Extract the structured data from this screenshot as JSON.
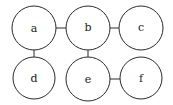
{
  "diagram": {
    "type": "graph",
    "nodes": [
      {
        "id": "a",
        "label": "a",
        "cx": 34,
        "cy": 28,
        "r": 22
      },
      {
        "id": "b",
        "label": "b",
        "cx": 88,
        "cy": 28,
        "r": 22
      },
      {
        "id": "c",
        "label": "c",
        "cx": 141,
        "cy": 28,
        "r": 22
      },
      {
        "id": "d",
        "label": "d",
        "cx": 34,
        "cy": 78,
        "r": 21
      },
      {
        "id": "e",
        "label": "e",
        "cx": 88,
        "cy": 79,
        "r": 22
      },
      {
        "id": "f",
        "label": "f",
        "cx": 141,
        "cy": 78,
        "r": 21
      }
    ],
    "edges": [
      {
        "from": "a",
        "to": "b"
      },
      {
        "from": "b",
        "to": "c"
      },
      {
        "from": "a",
        "to": "d"
      },
      {
        "from": "b",
        "to": "e"
      },
      {
        "from": "e",
        "to": "f"
      }
    ],
    "colors": {
      "stroke": "#2a2a2a",
      "fill": "#ffffff",
      "text": "#222222"
    }
  }
}
